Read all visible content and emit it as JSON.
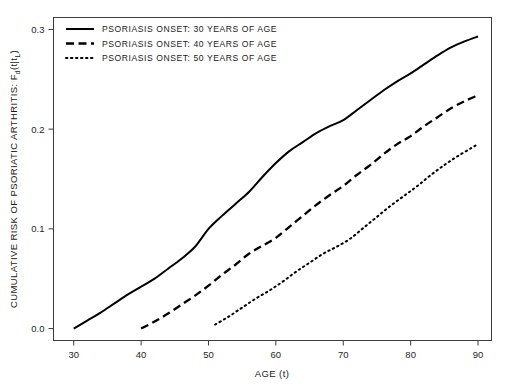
{
  "chart_data": {
    "type": "line",
    "title": "",
    "xlabel": "AGE (t)",
    "ylabel": "CUMULATIVE RISK OF PSORIATIC ARTHRITIS: F",
    "ylabel_sub1": "d",
    "ylabel_mid": "(t|t",
    "ylabel_sub2": "L",
    "ylabel_end": ")",
    "xlim": [
      27,
      92
    ],
    "ylim": [
      -0.012,
      0.312
    ],
    "xticks": [
      30,
      40,
      50,
      60,
      70,
      80,
      90
    ],
    "xtick_labels": [
      "30",
      "40",
      "50",
      "60",
      "70",
      "80",
      "90"
    ],
    "yticks": [
      0.0,
      0.1,
      0.2,
      0.3
    ],
    "ytick_labels": [
      "0.0",
      "0.1",
      "0.2",
      "0.3"
    ],
    "grid": false,
    "legend_position": "top-left",
    "line_color": "#000000",
    "series": [
      {
        "name": "PSORIASIS ONSET: 30 YEARS OF AGE",
        "style": "solid",
        "x": [
          30,
          32,
          34,
          36,
          38,
          40,
          42,
          44,
          46,
          48,
          50,
          52,
          54,
          56,
          58,
          60,
          62,
          64,
          66,
          68,
          70,
          72,
          74,
          76,
          78,
          80,
          82,
          84,
          86,
          88,
          90
        ],
        "y": [
          0.0,
          0.008,
          0.016,
          0.025,
          0.034,
          0.042,
          0.05,
          0.06,
          0.07,
          0.082,
          0.1,
          0.113,
          0.125,
          0.137,
          0.152,
          0.166,
          0.178,
          0.187,
          0.196,
          0.203,
          0.209,
          0.219,
          0.229,
          0.239,
          0.248,
          0.256,
          0.265,
          0.274,
          0.282,
          0.288,
          0.293
        ]
      },
      {
        "name": "PSORIASIS ONSET: 40 YEARS OF AGE",
        "style": "dashed",
        "x": [
          40,
          42,
          44,
          46,
          48,
          50,
          52,
          54,
          56,
          58,
          60,
          62,
          64,
          66,
          68,
          70,
          72,
          74,
          76,
          78,
          80,
          82,
          84,
          86,
          88,
          90
        ],
        "y": [
          0.0,
          0.007,
          0.015,
          0.024,
          0.033,
          0.043,
          0.054,
          0.064,
          0.075,
          0.083,
          0.091,
          0.102,
          0.113,
          0.124,
          0.134,
          0.143,
          0.154,
          0.164,
          0.175,
          0.185,
          0.193,
          0.203,
          0.212,
          0.221,
          0.228,
          0.234
        ]
      },
      {
        "name": "PSORIASIS ONSET: 50 YEARS OF AGE",
        "style": "dotted",
        "x": [
          51,
          53,
          55,
          57,
          59,
          61,
          63,
          65,
          67,
          69,
          71,
          73,
          75,
          77,
          79,
          81,
          83,
          85,
          87,
          89,
          90
        ],
        "y": [
          0.004,
          0.012,
          0.021,
          0.03,
          0.038,
          0.047,
          0.057,
          0.066,
          0.075,
          0.082,
          0.09,
          0.101,
          0.112,
          0.123,
          0.133,
          0.143,
          0.154,
          0.164,
          0.173,
          0.181,
          0.185
        ]
      }
    ]
  },
  "legend": {
    "items": [
      {
        "label": "PSORIASIS ONSET: 30 YEARS OF AGE",
        "style": "solid"
      },
      {
        "label": "PSORIASIS ONSET: 40 YEARS OF AGE",
        "style": "dashed"
      },
      {
        "label": "PSORIASIS ONSET: 50 YEARS OF AGE",
        "style": "dotted"
      }
    ]
  }
}
